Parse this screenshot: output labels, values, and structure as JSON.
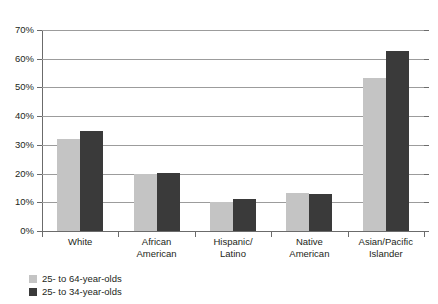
{
  "top_fragment": "clipped-heading",
  "chart_data": {
    "type": "bar",
    "title": "",
    "xlabel": "",
    "ylabel": "",
    "ylim": [
      0,
      70
    ],
    "ytick_values": [
      0,
      10,
      20,
      30,
      40,
      50,
      60,
      70
    ],
    "ytick_labels": [
      "0%",
      "10%",
      "20%",
      "30%",
      "40%",
      "50%",
      "60%",
      "70%"
    ],
    "grid": "horizontal",
    "legend_position": "bottom-left",
    "categories": [
      "White",
      "African\nAmerican",
      "Hispanic/\nLatino",
      "Native\nAmerican",
      "Asian/Pacific\nIslander"
    ],
    "category_labels": [
      [
        "White"
      ],
      [
        "African",
        "American"
      ],
      [
        "Hispanic/",
        "Latino"
      ],
      [
        "Native",
        "American"
      ],
      [
        "Asian/Pacific",
        "Islander"
      ]
    ],
    "series": [
      {
        "name": "25- to 64-year-olds",
        "color": "#c4c4c4",
        "values": [
          32.0,
          19.7,
          10.2,
          13.4,
          53.3
        ]
      },
      {
        "name": "25- to 34-year-olds",
        "color": "#3a3a3a",
        "values": [
          35.0,
          20.3,
          11.2,
          13.0,
          62.7
        ]
      }
    ]
  },
  "legend": {
    "items": [
      {
        "label": "25- to 64-year-olds",
        "color": "#c4c4c4"
      },
      {
        "label": "25- to 34-year-olds",
        "color": "#3a3a3a"
      }
    ]
  }
}
